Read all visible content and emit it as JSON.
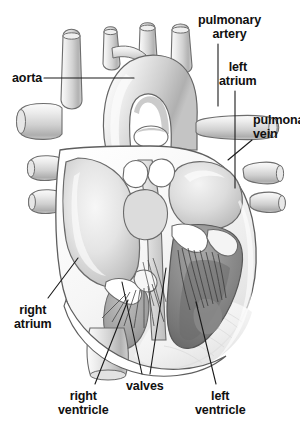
{
  "figure": {
    "background_color": "#ffffff",
    "width": 300,
    "height": 424
  },
  "labels": {
    "aorta": "aorta",
    "pulmonary_artery_line1": "pulmonary",
    "pulmonary_artery_line2": "artery",
    "left_atrium_line1": "left",
    "left_atrium_line2": "atrium",
    "pulmonary_vein_line1": "pulmona",
    "pulmonary_vein_line2": "vein",
    "right_atrium_line1": "right",
    "right_atrium_line2": "atrium",
    "right_ventricle_line1": "right",
    "right_ventricle_line2": "ventricle",
    "valves": "valves",
    "left_ventricle_line1": "left",
    "left_ventricle_line2": "ventricle"
  },
  "colors": {
    "text": "#101010",
    "leader_line": "#1a1a1a",
    "outline": "#5a5a5a",
    "vessel_light": "#e9e9e9",
    "vessel_mid": "#c9c9c9",
    "vessel_shadow": "#9a9a9a",
    "chamber_dark": "#8d8d8d",
    "myocardium_light": "#f2f2f2",
    "septum": "#b5b5b5"
  }
}
